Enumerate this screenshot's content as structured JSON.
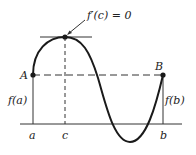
{
  "diagram": {
    "labels": {
      "derivative_note": "f′(c) = 0",
      "point_A": "A",
      "point_B": "B",
      "f_a": "f(a)",
      "f_b": "f(b)",
      "tick_a": "a",
      "tick_c": "c",
      "tick_b": "b"
    },
    "colors": {
      "line": "#222222",
      "curve": "#1a1a1a",
      "background": "#ffffff"
    }
  }
}
